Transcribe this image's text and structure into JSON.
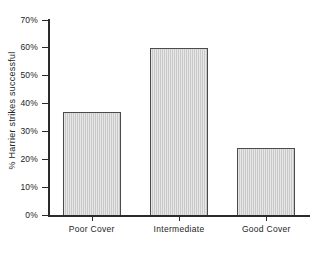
{
  "chart_data": {
    "type": "bar",
    "title": "",
    "subtitle": "",
    "xlabel": "",
    "ylabel": "% Harrier strikes successful",
    "categories": [
      "Poor Cover",
      "Intermediate",
      "Good Cover"
    ],
    "values": [
      37,
      60,
      24
    ],
    "ylim": [
      0,
      70
    ],
    "ytick_values": [
      0,
      10,
      20,
      30,
      40,
      50,
      60,
      70
    ],
    "ytick_labels": [
      "0%",
      "10%",
      "20%",
      "30%",
      "40%",
      "50%",
      "60%",
      "70%"
    ],
    "grid": false,
    "legend": false,
    "legend_position": "none",
    "value_unit": "%",
    "bar_fill_color": "#c9c9c9",
    "bar_edge_color": "#4a4a4a",
    "axis_color": "#2b2b2b",
    "background_color": "#ffffff"
  },
  "axes": {
    "y_title": "% Harrier strikes successful",
    "y_ticks": [
      {
        "label": "70%",
        "value": 70
      },
      {
        "label": "60%",
        "value": 60
      },
      {
        "label": "50%",
        "value": 50
      },
      {
        "label": "40%",
        "value": 40
      },
      {
        "label": "30%",
        "value": 30
      },
      {
        "label": "20%",
        "value": 20
      },
      {
        "label": "10%",
        "value": 10
      },
      {
        "label": "0%",
        "value": 0
      }
    ],
    "x_ticks": [
      {
        "label": "Poor Cover"
      },
      {
        "label": "Intermediate"
      },
      {
        "label": "Good Cover"
      }
    ]
  },
  "bars": [
    {
      "label": "Poor Cover",
      "value": 37
    },
    {
      "label": "Intermediate",
      "value": 60
    },
    {
      "label": "Good Cover",
      "value": 24
    }
  ]
}
